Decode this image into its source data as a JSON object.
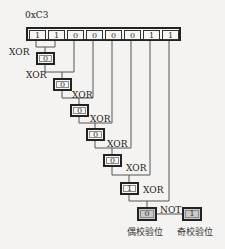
{
  "title": "0xC3",
  "input_bits": [
    "1",
    "1",
    "0",
    "0",
    "0",
    "0",
    "1",
    "1"
  ],
  "xor_steps": [
    {
      "op": "XOR",
      "result": "0"
    },
    {
      "op": "XOR",
      "result": "0"
    },
    {
      "op": "XOR",
      "result": "0"
    },
    {
      "op": "XOR",
      "result": "0"
    },
    {
      "op": "XOR",
      "result": "0"
    },
    {
      "op": "XOR",
      "result": "1"
    },
    {
      "op": "XOR",
      "result": "0"
    }
  ],
  "not_op": "NOT",
  "even_parity": {
    "value": "0",
    "label": "偶校验位"
  },
  "odd_parity": {
    "value": "1",
    "label": "奇校验位"
  },
  "colors": {
    "line": "#555555",
    "box_border": "#222222",
    "final_fill": "#c9c9c9",
    "background": "#f4f3f1"
  }
}
